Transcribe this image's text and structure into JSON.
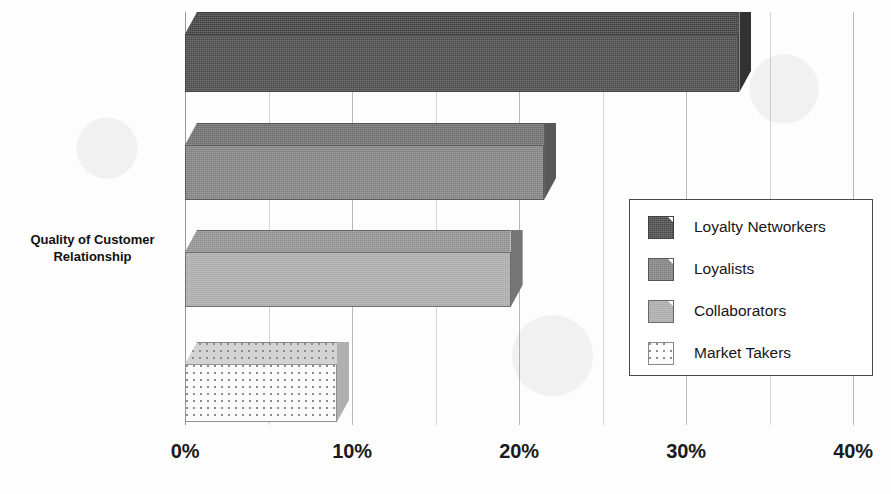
{
  "chart_data": {
    "type": "bar",
    "orientation": "horizontal",
    "title": "",
    "xlabel": "",
    "ylabel": "Quality of Customer Relationship",
    "ylabel_line1": "Quality of Customer",
    "ylabel_line2": "Relationship",
    "xlim": [
      0,
      40
    ],
    "xunit": "%",
    "grid": true,
    "grid_step": 5,
    "legend_position": "center-right",
    "categories": [
      "Loyalty Networkers",
      "Loyalists",
      "Collaborators",
      "Market Takers"
    ],
    "values": [
      33.2,
      21.5,
      19.5,
      9.1
    ],
    "ticks": [
      {
        "value": 0,
        "label": "0%"
      },
      {
        "value": 5,
        "label": ""
      },
      {
        "value": 10,
        "label": "10%"
      },
      {
        "value": 15,
        "label": ""
      },
      {
        "value": 20,
        "label": "20%"
      },
      {
        "value": 25,
        "label": ""
      },
      {
        "value": 30,
        "label": "30%"
      },
      {
        "value": 35,
        "label": ""
      },
      {
        "value": 40,
        "label": "40%"
      }
    ],
    "tick_labels": [
      "0%",
      "10%",
      "20%",
      "30%",
      "40%"
    ],
    "series": [
      {
        "name": "Loyalty Networkers",
        "value": 33.2,
        "color": "#474747"
      },
      {
        "name": "Loyalists",
        "value": 21.5,
        "color": "#7f7f7f"
      },
      {
        "name": "Collaborators",
        "value": 19.5,
        "color": "#a9a9a9"
      },
      {
        "name": "Market Takers",
        "value": 9.1,
        "color": "#fbfbfb"
      }
    ]
  },
  "axis": {
    "y_title_line1": "Quality of Customer",
    "y_title_line2": "Relationship",
    "x_tick_0": "0%",
    "x_tick_10": "10%",
    "x_tick_20": "20%",
    "x_tick_30": "30%",
    "x_tick_40": "40%"
  },
  "legend": {
    "items": [
      {
        "label": "Loyalty Networkers",
        "color": "#474747"
      },
      {
        "label": "Loyalists",
        "color": "#7f7f7f"
      },
      {
        "label": "Collaborators",
        "color": "#a9a9a9"
      },
      {
        "label": "Market Takers",
        "color": "#fbfbfb"
      }
    ]
  }
}
